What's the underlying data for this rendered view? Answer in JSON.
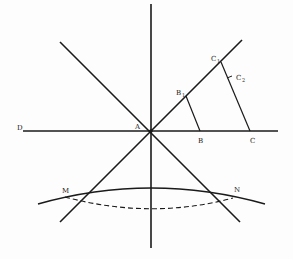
{
  "diagram": {
    "labels": {
      "A": "A",
      "B": "B",
      "C": "C",
      "D": "D",
      "B1": "B",
      "B1_sub": "1",
      "C1": "C",
      "C1_sub": "1",
      "C2": "C",
      "C2_sub": "2",
      "M": "M",
      "N": "N"
    },
    "colors": {
      "stroke": "#1a1a1a",
      "background": "#fdfdfd"
    }
  }
}
